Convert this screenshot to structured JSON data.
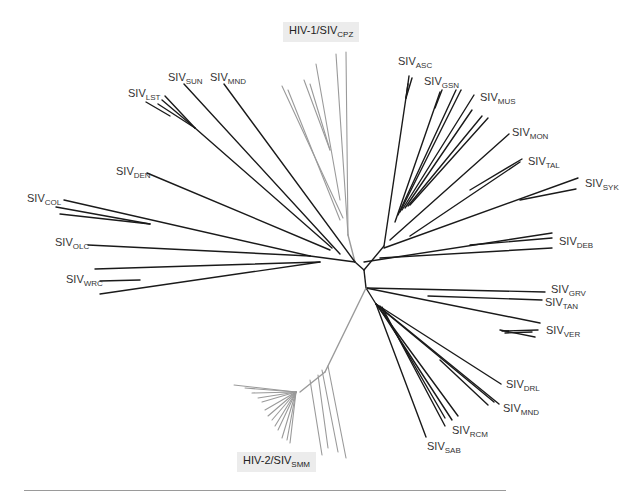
{
  "figure": {
    "type": "unrooted phylogenetic tree",
    "group_labels": [
      {
        "id": "hiv1",
        "prefix": "HIV-1/SIV",
        "sub": "CPZ",
        "color": "#9a9a9a"
      },
      {
        "id": "hiv2",
        "prefix": "HIV-2/SIV",
        "sub": "SMM",
        "color": "#9a9a9a"
      }
    ],
    "lineage_labels": [
      {
        "id": "asc",
        "prefix": "SIV",
        "sub": "ASC"
      },
      {
        "id": "gsn",
        "prefix": "SIV",
        "sub": "GSN"
      },
      {
        "id": "mus",
        "prefix": "SIV",
        "sub": "MUS"
      },
      {
        "id": "mon",
        "prefix": "SIV",
        "sub": "MON"
      },
      {
        "id": "tal",
        "prefix": "SIV",
        "sub": "TAL"
      },
      {
        "id": "syk",
        "prefix": "SIV",
        "sub": "SYK"
      },
      {
        "id": "deb",
        "prefix": "SIV",
        "sub": "DEB"
      },
      {
        "id": "grv",
        "prefix": "SIV",
        "sub": "GRV"
      },
      {
        "id": "tan",
        "prefix": "SIV",
        "sub": "TAN"
      },
      {
        "id": "ver",
        "prefix": "SIV",
        "sub": "VER"
      },
      {
        "id": "drl",
        "prefix": "SIV",
        "sub": "DRL"
      },
      {
        "id": "mnd2",
        "prefix": "SIV",
        "sub": "MND"
      },
      {
        "id": "rcm",
        "prefix": "SIV",
        "sub": "RCM"
      },
      {
        "id": "sab",
        "prefix": "SIV",
        "sub": "SAB"
      },
      {
        "id": "wrc",
        "prefix": "SIV",
        "sub": "WRC"
      },
      {
        "id": "olc",
        "prefix": "SIV",
        "sub": "OLC"
      },
      {
        "id": "col",
        "prefix": "SIV",
        "sub": "COL"
      },
      {
        "id": "den",
        "prefix": "SIV",
        "sub": "DEN"
      },
      {
        "id": "lst",
        "prefix": "SIV",
        "sub": "LST"
      },
      {
        "id": "sun",
        "prefix": "SIV",
        "sub": "SUN"
      },
      {
        "id": "mnd1",
        "prefix": "SIV",
        "sub": "MND"
      }
    ],
    "colors": {
      "primate_lentivirus_branch": "#1a1a1a",
      "human_lineage_branch": "#9a9a9a",
      "rule": "#9a9a9a"
    }
  }
}
